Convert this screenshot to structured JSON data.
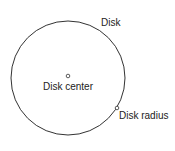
{
  "diagram": {
    "labels": {
      "disk": "Disk",
      "center": "Disk center",
      "radius": "Disk radius"
    },
    "colors": {
      "stroke": "#333333",
      "background": "#ffffff"
    }
  }
}
